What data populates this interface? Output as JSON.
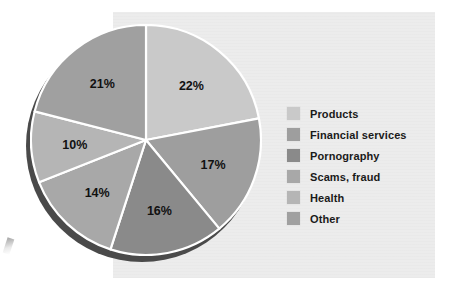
{
  "chart_data": {
    "type": "pie",
    "title": "",
    "subtitle": "",
    "xlabel": "",
    "ylabel": "",
    "grid": false,
    "legend_position": "right",
    "unit": "%",
    "start_angle_deg": 0,
    "direction": "clockwise",
    "categories": [
      "Products",
      "Financial services",
      "Pornography",
      "Scams, fraud",
      "Health",
      "Other"
    ],
    "values": [
      22,
      17,
      16,
      14,
      10,
      21
    ],
    "labels": [
      "22%",
      "17%",
      "16%",
      "14%",
      "10%",
      "21%"
    ],
    "colors": [
      "#c9c9c9",
      "#9e9e9e",
      "#8a8a8a",
      "#a8a8a8",
      "#b5b5b5",
      "#a0a0a0"
    ],
    "slices": [
      {
        "name": "Products",
        "value": 22,
        "label": "22%",
        "color": "#c9c9c9"
      },
      {
        "name": "Financial services",
        "value": 17,
        "label": "17%",
        "color": "#9e9e9e"
      },
      {
        "name": "Pornography",
        "value": 16,
        "label": "16%",
        "color": "#8a8a8a"
      },
      {
        "name": "Scams, fraud",
        "value": 14,
        "label": "14%",
        "color": "#a8a8a8"
      },
      {
        "name": "Health",
        "value": 10,
        "label": "10%",
        "color": "#b5b5b5"
      },
      {
        "name": "Other",
        "value": 21,
        "label": "21%",
        "color": "#a0a0a0"
      }
    ]
  },
  "legend": {
    "items": [
      {
        "label": "Products",
        "color": "#c9c9c9"
      },
      {
        "label": "Financial services",
        "color": "#9e9e9e"
      },
      {
        "label": "Pornography",
        "color": "#8a8a8a"
      },
      {
        "label": "Scams, fraud",
        "color": "#a8a8a8"
      },
      {
        "label": "Health",
        "color": "#b5b5b5"
      },
      {
        "label": "Other",
        "color": "#a0a0a0"
      }
    ]
  },
  "style": {
    "panel_color": "#ececec",
    "page_color": "#ffffff",
    "slice_separator_color": "#ffffff",
    "pie_shadow_color": "#4a4a4a",
    "label_color": "#111111"
  }
}
